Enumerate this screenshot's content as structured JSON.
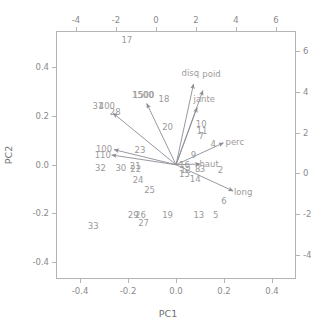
{
  "chart_data": {
    "type": "scatter",
    "subtype": "pca-biplot",
    "title": "",
    "xlabel": "PC1",
    "ylabel": "PC2",
    "xlim": [
      -0.5,
      0.5
    ],
    "ylim": [
      -0.47,
      0.55
    ],
    "grid": false,
    "legend": "none",
    "bottom_axis": {
      "label": "PC1",
      "ticks": [
        -0.4,
        -0.2,
        0.0,
        0.2,
        0.4
      ],
      "tick_labels": [
        "-0.4",
        "-0.2",
        "0.0",
        "0.2",
        "0.4"
      ]
    },
    "left_axis": {
      "label": "PC2",
      "ticks": [
        -0.4,
        -0.2,
        0.0,
        0.2,
        0.4
      ],
      "tick_labels": [
        "-0.4",
        "-0.2",
        "0.0",
        "0.2",
        "0.4"
      ]
    },
    "top_axis": {
      "label": "",
      "ticks": [
        -4,
        -2,
        0,
        2,
        4,
        6
      ],
      "tick_labels": [
        "-4",
        "-2",
        "0",
        "2",
        "4",
        "6"
      ]
    },
    "right_axis": {
      "label": "",
      "ticks": [
        -4,
        -2,
        0,
        2,
        4,
        6
      ],
      "tick_labels": [
        "-4",
        "-2",
        "0",
        "2",
        "4",
        "6"
      ]
    },
    "observations": [
      {
        "label": "17",
        "x": -0.205,
        "y": 0.515
      },
      {
        "label": "18",
        "x": -0.05,
        "y": 0.27
      },
      {
        "label": "1500",
        "x": -0.135,
        "y": 0.285
      },
      {
        "label": "31",
        "x": -0.325,
        "y": 0.24
      },
      {
        "label": "28",
        "x": -0.253,
        "y": 0.215
      },
      {
        "label": "20",
        "x": -0.035,
        "y": 0.155
      },
      {
        "label": "10",
        "x": 0.105,
        "y": 0.168
      },
      {
        "label": "11",
        "x": 0.108,
        "y": 0.138
      },
      {
        "label": "7",
        "x": 0.105,
        "y": 0.118
      },
      {
        "label": "4",
        "x": 0.155,
        "y": 0.085
      },
      {
        "label": "23",
        "x": -0.15,
        "y": 0.06
      },
      {
        "label": "9",
        "x": 0.073,
        "y": 0.038
      },
      {
        "label": "32",
        "x": -0.315,
        "y": -0.015
      },
      {
        "label": "30",
        "x": -0.23,
        "y": -0.012
      },
      {
        "label": "21",
        "x": -0.17,
        "y": -0.005
      },
      {
        "label": "22",
        "x": -0.168,
        "y": -0.018
      },
      {
        "label": "16",
        "x": 0.035,
        "y": 0.0
      },
      {
        "label": "12",
        "x": 0.04,
        "y": -0.022
      },
      {
        "label": "15",
        "x": 0.035,
        "y": -0.04
      },
      {
        "label": "8",
        "x": 0.09,
        "y": -0.018
      },
      {
        "label": "3",
        "x": 0.11,
        "y": -0.018
      },
      {
        "label": "2",
        "x": 0.185,
        "y": -0.02
      },
      {
        "label": "24",
        "x": -0.158,
        "y": -0.062
      },
      {
        "label": "14",
        "x": 0.08,
        "y": -0.06
      },
      {
        "label": "25",
        "x": -0.11,
        "y": -0.105
      },
      {
        "label": "6",
        "x": 0.2,
        "y": -0.148
      },
      {
        "label": "29",
        "x": -0.178,
        "y": -0.205
      },
      {
        "label": "26",
        "x": -0.148,
        "y": -0.205
      },
      {
        "label": "19",
        "x": -0.035,
        "y": -0.205
      },
      {
        "label": "13",
        "x": 0.095,
        "y": -0.205
      },
      {
        "label": "5",
        "x": 0.165,
        "y": -0.208
      },
      {
        "label": "27",
        "x": -0.135,
        "y": -0.24
      },
      {
        "label": "33",
        "x": -0.345,
        "y": -0.25
      }
    ],
    "variables": [
      {
        "label": "disq",
        "x": 0.073,
        "y": 0.332,
        "label_x": 0.06,
        "label_y": 0.378
      },
      {
        "label": "poid",
        "x": 0.112,
        "y": 0.305,
        "label_x": 0.148,
        "label_y": 0.372
      },
      {
        "label": "jante",
        "x": 0.088,
        "y": 0.235,
        "label_x": 0.118,
        "label_y": 0.272
      },
      {
        "label": "perc",
        "x": 0.198,
        "y": 0.09,
        "label_x": 0.245,
        "label_y": 0.095
      },
      {
        "label": "haut",
        "x": 0.1,
        "y": 0.003,
        "label_x": 0.138,
        "label_y": 0.003
      },
      {
        "label": "long",
        "x": 0.238,
        "y": -0.108,
        "label_x": 0.28,
        "label_y": -0.112
      },
      {
        "label": "1500",
        "x": -0.122,
        "y": 0.252,
        "label_x": -0.138,
        "label_y": 0.288
      },
      {
        "label": "400",
        "x": -0.262,
        "y": 0.212,
        "label_x": -0.288,
        "label_y": 0.242
      },
      {
        "label": "100",
        "x": -0.258,
        "y": 0.062,
        "label_x": -0.3,
        "label_y": 0.065
      },
      {
        "label": "110",
        "x": -0.268,
        "y": 0.04,
        "label_x": -0.305,
        "label_y": 0.042
      }
    ],
    "origin": {
      "x": 0.0,
      "y": 0.0
    },
    "colors": {
      "points": "#9a9a9a",
      "arrows": "#8c8c96",
      "variable_labels": "#a09a9a",
      "axis": "#b4b4b4",
      "background": "#ffffff"
    }
  }
}
